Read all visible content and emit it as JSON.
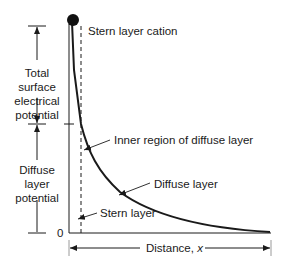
{
  "diagram": {
    "labels": {
      "stern_cation": "Stern layer cation",
      "total_potential": [
        "Total",
        "surface",
        "electrical",
        "potential"
      ],
      "diffuse_potential": [
        "Diffuse",
        "layer",
        "potential"
      ],
      "inner_region": "Inner region of diffuse layer",
      "diffuse_layer": "Diffuse layer",
      "stern_layer": "Stern layer",
      "origin": "0",
      "x_axis": "Distance, ",
      "x_var": "x"
    },
    "colors": {
      "ink": "#1a1a1a",
      "guide": "#9a9a9a",
      "background": "#ffffff"
    }
  }
}
